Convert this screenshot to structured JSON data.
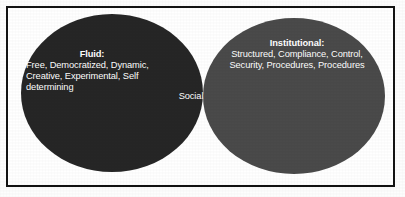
{
  "figure": {
    "type": "venn-diagram",
    "background_color": "#ffffff",
    "border_color": "#131313"
  },
  "left_circle": {
    "name": "fluid-circle",
    "heading": "Fluid:",
    "body": "Free, Democratized, Dynamic, Creative, Experimental, Self determining",
    "fill_color": "#262626",
    "text_color": "#ffffff"
  },
  "right_circle": {
    "name": "institutional-circle",
    "heading": "Institutional:",
    "body": "Structured, Compliance, Control, Security, Procedures, Procedures",
    "fill_color": "#4a4a4a",
    "text_color": "#ffffff"
  },
  "overlap": {
    "name": "social-overlap",
    "label": "Social",
    "fill_color": "#333333",
    "text_color": "#ffffff"
  }
}
